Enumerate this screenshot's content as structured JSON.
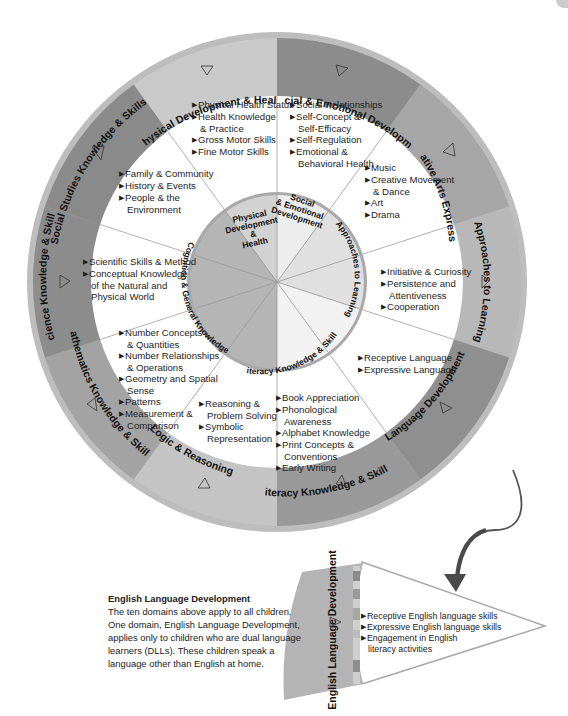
{
  "wheel": {
    "outer_segments": [
      {
        "label": "Physical Development & Health",
        "color": "#c9c9c9"
      },
      {
        "label": "Social & Emotional Development",
        "color": "#8c8c8c"
      },
      {
        "label": "Creative Arts Expression",
        "color": "#a6a6a6"
      },
      {
        "label": "Approaches to Learning",
        "color": "#b8b8b8"
      },
      {
        "label": "Language Development",
        "color": "#8f8f8f"
      },
      {
        "label": "Literacy Knowledge & Skills",
        "color": "#999999"
      },
      {
        "label": "Logic & Reasoning",
        "color": "#c4c4c4"
      },
      {
        "label": "Mathematics Knowledge & Skills",
        "color": "#a3a3a3"
      },
      {
        "label": "Science Knowledge & Skills",
        "color": "#8c8c8c"
      },
      {
        "label": "Social Studies Knowledge & Skills",
        "color": "#8a8a8a"
      }
    ],
    "inner_segments": [
      {
        "label": "Physical Development & Health",
        "lines": [
          "Physical",
          "Development",
          "&",
          "Health"
        ],
        "color": "#d2d2d2"
      },
      {
        "label": "Social & Emotional Development",
        "lines": [
          "Social",
          "& Emotional",
          "Development"
        ],
        "color": "#ededed"
      },
      {
        "label": "Approaches to Learning",
        "color": "#e0e0e0"
      },
      {
        "label": "Literacy Knowledge & Skills",
        "color": "#f2f2f2"
      },
      {
        "label": "Cognition & General Knowledge",
        "color": "#b5b5b5"
      }
    ],
    "sub_domains": {
      "physical": [
        "Physical Health Status",
        "Health Knowledge",
        "& Practice",
        "Gross Motor Skills",
        "Fine Motor Skills"
      ],
      "social_emotional": [
        "Social Relationships",
        "Self-Concept &",
        "Self-Efficacy",
        "Self-Regulation",
        "Emotional &",
        "Behavioral Health"
      ],
      "creative": [
        "Music",
        "Creative Movement",
        "& Dance",
        "Art",
        "Drama"
      ],
      "approaches": [
        "Initiative & Curiosity",
        "Persistence and",
        "Attentiveness",
        "Cooperation"
      ],
      "language": [
        "Receptive Language",
        "Expressive Language"
      ],
      "literacy": [
        "Book Appreciation",
        "Phonological",
        "Awareness",
        "Alphabet Knowledge",
        "Print Concepts &",
        "Conventions",
        "Early Writing"
      ],
      "logic": [
        "Reasoning &",
        "Problem Solving",
        "Symbolic",
        "Representation"
      ],
      "math": [
        "Number Concepts",
        "& Quantities",
        "Number Relationships",
        "& Operations",
        "Geometry and Spatial",
        "Sense",
        "Patterns",
        "Measurement &",
        "Comparison"
      ],
      "science": [
        "Scientific Skills & Method",
        "Conceptual Knowledge",
        "of the Natural and",
        "Physical World"
      ],
      "social_studies": [
        "Family & Community",
        "History & Events",
        "People & the",
        "Environment"
      ]
    }
  },
  "eld": {
    "band_label": "English Language Development",
    "items": [
      "Receptive English language skills",
      "Expressive English language skills",
      "Engagement in English",
      "literacy activities"
    ]
  },
  "caption": {
    "title": "English Language Development",
    "body": "The ten domains above apply to all children. One domain, English Language Development, applies only to children who are dual language learners (DLLs). These children speak a language other than English at home."
  }
}
